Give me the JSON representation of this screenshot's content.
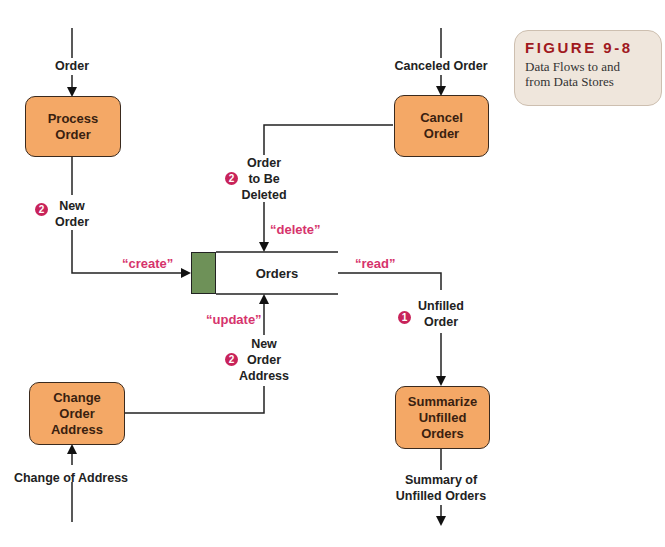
{
  "figure": {
    "title": "FIGURE 9-8",
    "caption": "Data Flows to and\nfrom Data Stores"
  },
  "processes": {
    "process_order": "Process\nOrder",
    "cancel_order": "Cancel\nOrder",
    "change_order_address": "Change\nOrder\nAddress",
    "summarize_unfilled_orders": "Summarize\nUnfilled\nOrders"
  },
  "data_store": {
    "name": "Orders"
  },
  "flows": {
    "order": "Order",
    "canceled_order": "Canceled Order",
    "new_order": "New\nOrder",
    "order_to_be_deleted": "Order\nto Be\nDeleted",
    "unfilled_order": "Unfilled\nOrder",
    "new_order_address": "New\nOrder\nAddress",
    "change_of_address": "Change of Address",
    "summary_of_unfilled_orders": "Summary of\nUnfilled Orders"
  },
  "operations": {
    "create": "“create”",
    "delete": "“delete”",
    "read": "“read”",
    "update": "“update”"
  },
  "badges": {
    "new_order": "2",
    "order_to_be_deleted": "2",
    "unfilled_order": "1",
    "new_order_address": "2"
  },
  "colors": {
    "process_fill": "#f4a866",
    "store_id_fill": "#6e9158",
    "operation_text": "#d6336c",
    "badge": "#c8235a",
    "figure_title": "#a0191e"
  }
}
